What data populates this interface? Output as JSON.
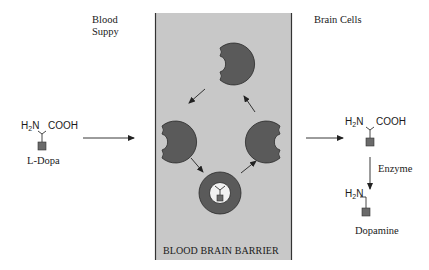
{
  "diagram": {
    "regions": {
      "blood_supply": {
        "label_line1": "Blood",
        "label_line2": "Suppy"
      },
      "brain_cells": {
        "label": "Brain Cells"
      },
      "barrier": {
        "label": "BLOOD BRAIN BARRIER",
        "fill": "#c8c8c8",
        "border": "#333333"
      }
    },
    "molecules": {
      "l_dopa": {
        "name": "L-Dopa",
        "amine": "H",
        "amine_sub": "2",
        "amine_suffix": "N",
        "acid": "COOH"
      },
      "l_dopa_brain": {
        "amine": "H",
        "amine_sub": "2",
        "amine_suffix": "N",
        "acid": "COOH"
      },
      "dopamine": {
        "name": "Dopamine",
        "amine": "H",
        "amine_sub": "2",
        "amine_suffix": "N"
      }
    },
    "process": {
      "enzyme_label": "Enzyme"
    },
    "colors": {
      "carrier": "#5a5a5a",
      "carrier_stroke": "#2a2a2a",
      "ring_inner": "#f2f2f2",
      "group_square": "#6a6a6a",
      "arrow": "#222222"
    }
  }
}
